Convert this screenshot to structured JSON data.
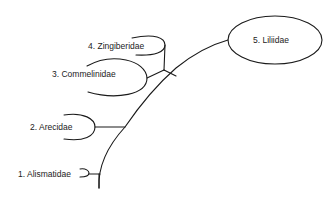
{
  "diagram": {
    "type": "phylogenetic-tree",
    "colors": {
      "line": "#1a1a1a",
      "text": "#222222",
      "background": "#ffffff"
    },
    "nodes": [
      {
        "id": "alismatidae",
        "number": "1",
        "name": "Alismatidae",
        "label": "1. Alismatidae"
      },
      {
        "id": "arecidae",
        "number": "2",
        "name": "Arecidae",
        "label": "2. Arecidae"
      },
      {
        "id": "commelinidae",
        "number": "3",
        "name": "Commelinidae",
        "label": "3. Commelinidae"
      },
      {
        "id": "zingiberidae",
        "number": "4",
        "name": "Zingiberidae",
        "label": "4. Zingiberidae"
      },
      {
        "id": "liliidae",
        "number": "5",
        "name": "Liliidae",
        "label": "5. Liliidae"
      }
    ]
  }
}
